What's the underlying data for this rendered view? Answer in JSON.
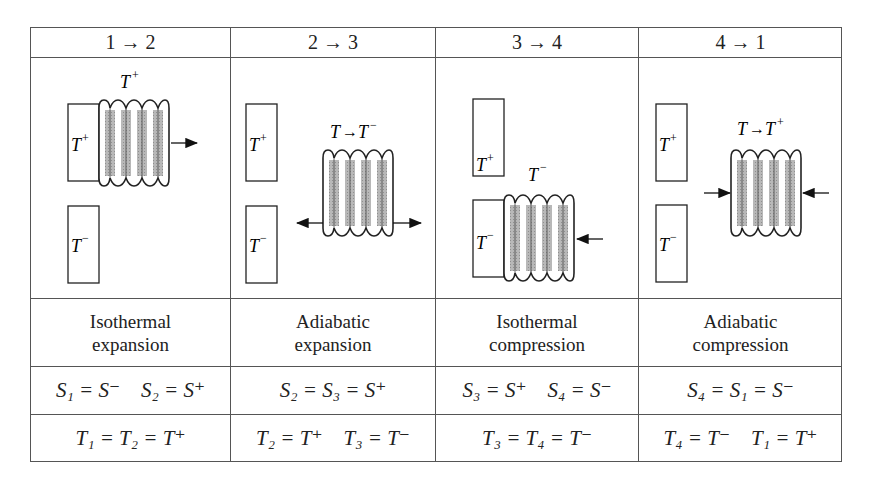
{
  "table": {
    "headers": [
      "1 → 2",
      "2 → 3",
      "3 → 4",
      "4 → 1"
    ],
    "diagrams": [
      {
        "top_label": "T⁺",
        "hot_reservoir": "T⁺",
        "cold_reservoir": "T⁻",
        "contact": "hot",
        "arrows": "expand-right"
      },
      {
        "top_label": "T→T⁻",
        "hot_reservoir": "T⁺",
        "cold_reservoir": "T⁻",
        "contact": "none",
        "arrows": "expand-both"
      },
      {
        "top_label": "T⁻",
        "hot_reservoir": "T⁺",
        "cold_reservoir": "T⁻",
        "contact": "cold",
        "arrows": "compress-right"
      },
      {
        "top_label": "T→T⁺",
        "hot_reservoir": "T⁺",
        "cold_reservoir": "T⁻",
        "contact": "none",
        "arrows": "compress-both"
      }
    ],
    "descriptions": [
      [
        "Isothermal",
        "expansion"
      ],
      [
        "Adiabatic",
        "expansion"
      ],
      [
        "Isothermal",
        "compression"
      ],
      [
        "Adiabatic",
        "compression"
      ]
    ],
    "entropy_row": [
      "S₁ = S⁻    S₂ = S⁺",
      "S₂ = S₃ = S⁺",
      "S₃ = S⁺    S₄ = S⁻",
      "S₄ = S₁ = S⁻"
    ],
    "temperature_row": [
      "T₁ = T₂ = T⁺",
      "T₂ = T⁺    T₃ = T⁻",
      "T₃ = T₄ = T⁻",
      "T₄ = T⁻    T₁ = T⁺"
    ]
  },
  "labels": {
    "T": "T",
    "S": "S",
    "plus": "+",
    "minus": "−",
    "arrow": "→",
    "eq": "="
  }
}
